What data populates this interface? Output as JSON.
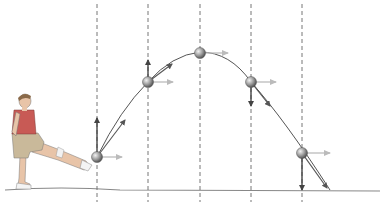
{
  "diagram": {
    "caption_cropped": "",
    "colors": {
      "background": "#ffffff",
      "trajectory": "#555555",
      "dashed_line": "#666666",
      "ground": "#888888",
      "velocity_arrow": "#555555",
      "component_vertical": "#444444",
      "component_horizontal": "#bbbbbb",
      "ball": "#8a8a8a",
      "shirt": "#c85a55",
      "shorts": "#c9b99a",
      "skin": "#e8c4a8"
    },
    "ground_y": 191,
    "dashed_lines_x": [
      97,
      148,
      200,
      251,
      302
    ],
    "balls": [
      {
        "id": 1,
        "x": 97,
        "y": 157,
        "vertical": {
          "dir": "up",
          "tip_y": 118
        },
        "horizontal_tip_x": 122,
        "velocity_tip": [
          125,
          120
        ]
      },
      {
        "id": 2,
        "x": 148,
        "y": 82,
        "vertical": {
          "dir": "up",
          "tip_y": 60
        },
        "horizontal_tip_x": 173,
        "velocity_tip": [
          172,
          64
        ]
      },
      {
        "id": 3,
        "x": 200,
        "y": 53,
        "vertical": null,
        "horizontal_tip_x": 228,
        "velocity_tip": null
      },
      {
        "id": 4,
        "x": 251,
        "y": 82,
        "vertical": {
          "dir": "down",
          "tip_y": 106
        },
        "horizontal_tip_x": 276,
        "velocity_tip": [
          270,
          106
        ]
      },
      {
        "id": 5,
        "x": 302,
        "y": 153,
        "vertical": {
          "dir": "down",
          "tip_y": 190
        },
        "horizontal_tip_x": 330,
        "velocity_tip": [
          327,
          188
        ]
      }
    ],
    "figure": {
      "label": "person kicking ball"
    }
  }
}
